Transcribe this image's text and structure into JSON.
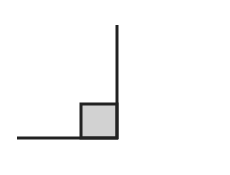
{
  "diagram": {
    "type": "right-angle",
    "width": 230,
    "height": 175,
    "background": "#ffffff",
    "stroke_color": "#222222",
    "stroke_width": 3,
    "square_fill": "#d2d2d2",
    "horizontal_ray": {
      "x1": 17,
      "y1": 138,
      "x2": 118,
      "y2": 138
    },
    "vertical_ray": {
      "x1": 117,
      "y1": 25,
      "x2": 117,
      "y2": 139
    },
    "right_angle_marker": {
      "x": 81,
      "y": 104,
      "width": 36,
      "height": 34
    }
  }
}
